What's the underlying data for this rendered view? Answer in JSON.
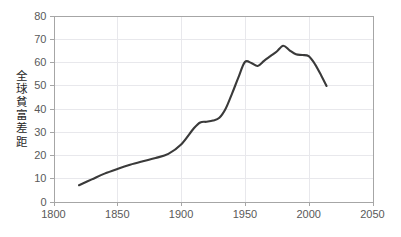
{
  "chart_data": {
    "type": "line",
    "title": "",
    "subtitle": "",
    "xlabel": "",
    "ylabel": "全球貧富差距",
    "ylabel_chars": [
      "全",
      "球",
      "貧",
      "富",
      "差",
      "距"
    ],
    "xlim": [
      1800,
      2050
    ],
    "ylim": [
      0,
      80
    ],
    "xticks": [
      1800,
      1850,
      1900,
      1950,
      2000,
      2050
    ],
    "xtick_labels": [
      "1800",
      "1850",
      "1900",
      "1950",
      "2000",
      "2050"
    ],
    "yticks": [
      0,
      10,
      20,
      30,
      40,
      50,
      60,
      70,
      80
    ],
    "ytick_labels": [
      "0",
      "10",
      "20",
      "30",
      "40",
      "50",
      "60",
      "70",
      "80"
    ],
    "grid": "horizontal-and-vertical-light",
    "legend": "none",
    "series": [
      {
        "name": "全球貧富差距",
        "color": "#3a3a3a",
        "x": [
          1820,
          1830,
          1840,
          1850,
          1860,
          1870,
          1880,
          1890,
          1900,
          1910,
          1915,
          1920,
          1925,
          1930,
          1935,
          1940,
          1945,
          1950,
          1955,
          1960,
          1965,
          1970,
          1975,
          1980,
          1985,
          1990,
          1995,
          2000,
          2005,
          2010,
          2014
        ],
        "y": [
          7.0,
          9.5,
          12.0,
          14.0,
          15.8,
          17.3,
          18.7,
          20.5,
          24.5,
          31.5,
          34.0,
          34.3,
          34.8,
          36.0,
          40.0,
          46.5,
          53.5,
          60.0,
          59.6,
          58.3,
          60.5,
          62.5,
          64.5,
          67.0,
          65.0,
          63.3,
          63.0,
          62.5,
          59.0,
          54.0,
          49.7
        ]
      }
    ],
    "colors": {
      "line": "#3a3a3a",
      "grid": "#e8e8ec",
      "axis": "#a6a6a6",
      "tick_text": "#595959",
      "axis_title": "#262626",
      "background": "#ffffff"
    }
  }
}
